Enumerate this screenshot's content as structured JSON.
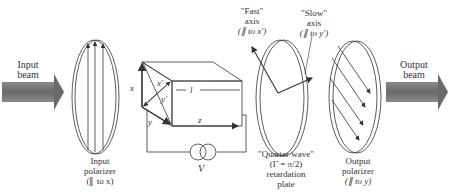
{
  "diagram": {
    "colors": {
      "line": "#333333",
      "beam": "#707070",
      "text": "#333333"
    },
    "input_beam": {
      "label_line1": "Input",
      "label_line2": "beam"
    },
    "output_beam": {
      "label_line1": "Output",
      "label_line2": "beam"
    },
    "input_polarizer": {
      "line1": "Input",
      "line2": "polarizer",
      "line3": "(∥ to x)"
    },
    "crystal": {
      "axis_x": "x",
      "axis_y": "y",
      "axis_z": "z",
      "axis_x_prime": "x′",
      "axis_y_prime": "y′",
      "length": "l",
      "voltage": "V"
    },
    "fast_axis": {
      "line1": "\"Fast\"",
      "line2": "axis",
      "line3": "(∥ to x′)"
    },
    "slow_axis": {
      "line1": "\"Slow\"",
      "line2": "axis",
      "line3": "(∥ to y′)"
    },
    "quarter_wave": {
      "line1": "\"Quarter wave\"",
      "line2": "(Γ = π/2)",
      "line3": "retardation",
      "line4": "plate"
    },
    "output_polarizer": {
      "line1": "Output",
      "line2": "polarizer",
      "line3": "(∥ to y)"
    }
  }
}
